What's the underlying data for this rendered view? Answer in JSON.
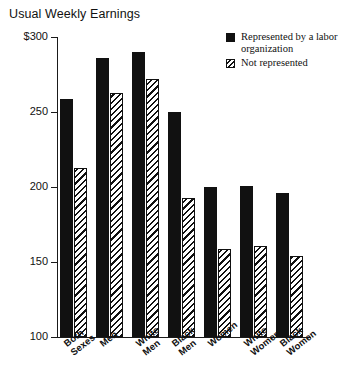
{
  "chart_data": {
    "type": "bar",
    "title": "Usual Weekly Earnings",
    "xlabel": "",
    "ylabel": "",
    "ylim": [
      100,
      300
    ],
    "yticks": [
      100,
      150,
      200,
      250,
      300
    ],
    "ytick_labels": [
      "100",
      "150",
      "200",
      "250",
      "$300"
    ],
    "grid": false,
    "legend_position": "top-right",
    "categories": [
      "Both\nSexes",
      "Men",
      "White\nMen",
      "Black\nMen",
      "Women",
      "White\nWomen",
      "Black\nWomen"
    ],
    "series": [
      {
        "name": "Represented by a labor organization",
        "pattern": "solid",
        "values": [
          259,
          286,
          290,
          250,
          200,
          201,
          196
        ]
      },
      {
        "name": "Not represented",
        "pattern": "hatched",
        "values": [
          213,
          263,
          272,
          193,
          159,
          161,
          154
        ]
      }
    ]
  },
  "legend": {
    "items": [
      {
        "label": "Represented by a\nlabor organization",
        "swatch": "solid-square-icon"
      },
      {
        "label": "Not represented",
        "swatch": "hatched-square-icon"
      }
    ]
  },
  "colors": {
    "ink": "#111111",
    "background": "#ffffff"
  }
}
